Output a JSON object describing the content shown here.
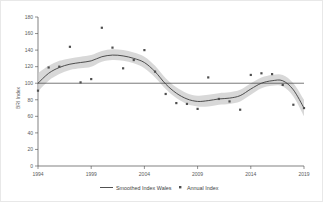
{
  "chart_data": {
    "type": "line",
    "title": "",
    "xlabel": "",
    "ylabel": "BRI Index",
    "xlim": [
      1994,
      2019
    ],
    "ylim": [
      0,
      180
    ],
    "grid": false,
    "legend_position": "bottom",
    "x_ticks": [
      "1994",
      "1999",
      "2004",
      "2009",
      "2014",
      "2019"
    ],
    "y_ticks": [
      "0",
      "20",
      "40",
      "60",
      "80",
      "100",
      "120",
      "140",
      "160",
      "180"
    ],
    "reference_line": {
      "label": "Baseline 100",
      "value": 100
    },
    "legend": [
      {
        "label": "Smoothed Index Wales",
        "marker": "line",
        "color": "#3d3d3d"
      },
      {
        "label": "Annual Index",
        "marker": "square",
        "color": "#4f4f4f"
      }
    ],
    "series": [
      {
        "name": "Annual Index",
        "type": "scatter",
        "x": [
          1994,
          1995,
          1996,
          1997,
          1998,
          1999,
          2000,
          2001,
          2002,
          2003,
          2004,
          2005,
          2006,
          2007,
          2008,
          2009,
          2010,
          2011,
          2012,
          2013,
          2014,
          2015,
          2016,
          2017,
          2018,
          2019
        ],
        "values": [
          91,
          119,
          120,
          144,
          101,
          105,
          167,
          143,
          118,
          128,
          140,
          114,
          87,
          76,
          75,
          69,
          107,
          81,
          78,
          68,
          110,
          112,
          111,
          98,
          74,
          70
        ]
      },
      {
        "name": "Smoothed Index Wales",
        "type": "line",
        "x": [
          1994,
          1995,
          1996,
          1997,
          1998,
          1999,
          2000,
          2001,
          2002,
          2003,
          2004,
          2005,
          2006,
          2007,
          2008,
          2009,
          2010,
          2011,
          2012,
          2013,
          2014,
          2015,
          2016,
          2017,
          2018,
          2019
        ],
        "values": [
          100,
          112,
          119,
          123,
          125,
          127,
          132,
          134,
          133,
          130,
          125,
          114,
          99,
          88,
          81,
          78,
          79,
          81,
          82,
          85,
          93,
          100,
          103,
          103,
          92,
          70
        ],
        "band_lower": [
          90,
          103,
          111,
          116,
          118,
          120,
          126,
          128,
          127,
          124,
          118,
          107,
          93,
          82,
          75,
          72,
          72,
          74,
          75,
          78,
          86,
          94,
          97,
          96,
          84,
          60
        ],
        "band_upper": [
          112,
          121,
          127,
          130,
          132,
          134,
          139,
          141,
          140,
          137,
          132,
          121,
          106,
          95,
          88,
          85,
          86,
          88,
          89,
          92,
          100,
          107,
          110,
          110,
          100,
          80
        ]
      }
    ]
  }
}
